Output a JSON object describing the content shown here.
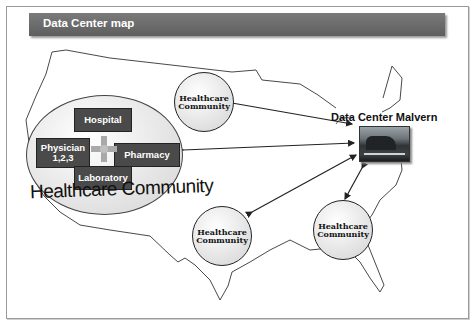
{
  "header": {
    "title": "Data Center map"
  },
  "main_community": {
    "label": "Healthcare Community",
    "nodes": {
      "top": "Hospital",
      "left_line1": "Physician",
      "left_line2": "1,2,3",
      "right": "Pharmacy",
      "bottom": "Laboratory"
    }
  },
  "satellite_communities": [
    {
      "line1": "Healthcare",
      "line2": "Community"
    },
    {
      "line1": "Healthcare",
      "line2": "Community"
    },
    {
      "line1": "Healthcare",
      "line2": "Community"
    }
  ],
  "data_center": {
    "label": "Data Center Malvern",
    "icon": "data-center-photo"
  },
  "colors": {
    "title_bar": "#666666",
    "node_box": "#4a4a4a",
    "map_outline": "#333333"
  }
}
